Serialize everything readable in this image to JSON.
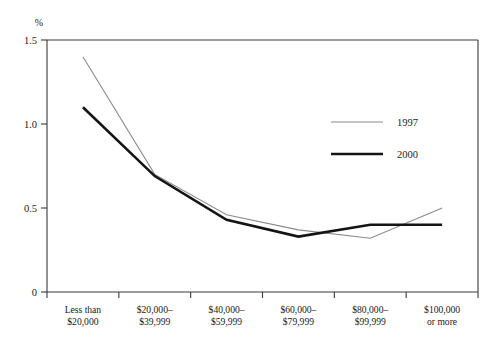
{
  "chart_data": {
    "type": "line",
    "title": "",
    "xlabel": "",
    "ylabel": "%",
    "categories": [
      "Less than\n$20,000",
      "$20,000–\n$39,999",
      "$40,000–\n$59,999",
      "$60,000–\n$79,999",
      "$80,000–\n$99,999",
      "$100,000\nor more"
    ],
    "category_lines": [
      [
        "Less than",
        "$20,000"
      ],
      [
        "$20,000–",
        "$39,999"
      ],
      [
        "$40,000–",
        "$59,999"
      ],
      [
        "$60,000–",
        "$79,999"
      ],
      [
        "$80,000–",
        "$99,999"
      ],
      [
        "$100,000",
        "or more"
      ]
    ],
    "series": [
      {
        "name": "1997",
        "color": "#8a8a8a",
        "width": 1.1,
        "values": [
          1.4,
          0.7,
          0.46,
          0.37,
          0.32,
          0.5
        ]
      },
      {
        "name": "2000",
        "color": "#141414",
        "width": 2.6,
        "values": [
          1.1,
          0.69,
          0.43,
          0.33,
          0.4,
          0.4
        ]
      }
    ],
    "ylim": [
      0,
      1.5
    ],
    "yticks": [
      0,
      0.5,
      1.0,
      1.5
    ],
    "ytick_labels": [
      "0",
      "0.5",
      "1.0",
      "1.5"
    ],
    "grid": false,
    "legend_position": "center-right"
  },
  "legend": {
    "entries": [
      {
        "label": "1997"
      },
      {
        "label": "2000"
      }
    ]
  },
  "axes": {
    "y_unit_label": "%"
  }
}
